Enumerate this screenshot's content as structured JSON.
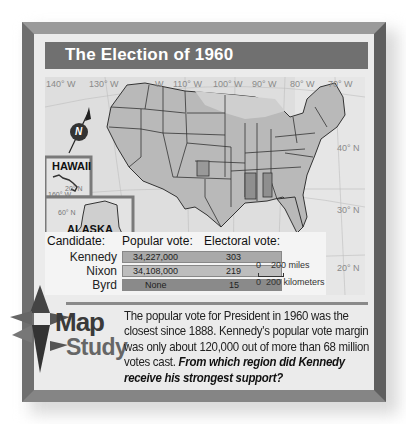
{
  "title": "The Election of 1960",
  "map": {
    "longitude_labels": [
      "140° W",
      "130° W",
      "W",
      "110° W",
      "100° W",
      "90° W",
      "80° W",
      "70° W"
    ],
    "latitude_labels": [
      "40° N",
      "30° N",
      "20° N"
    ],
    "compass_icon": "north-arrow",
    "compass_letter": "N",
    "insets": {
      "hawaii": {
        "label": "HAWAII",
        "lat": "20° N",
        "lon": "160° W"
      },
      "alaska": {
        "label": "ALASKA",
        "lat": "60° N",
        "lon": "170° W"
      }
    },
    "scale": {
      "miles": "0    200 miles",
      "km": "0  200 kilometers"
    }
  },
  "legend": {
    "headers": {
      "candidate": "Candidate:",
      "popular": "Popular vote:",
      "electoral": "Electoral vote:"
    },
    "rows": [
      {
        "candidate": "Kennedy",
        "popular": "34,227,000",
        "electoral": "303",
        "color": "#a9a9a9"
      },
      {
        "candidate": "Nixon",
        "popular": "34,108,000",
        "electoral": "219",
        "color": "#bdbdbd"
      },
      {
        "candidate": "Byrd",
        "popular": "None",
        "electoral": "15",
        "color": "#8a8a8a"
      }
    ]
  },
  "map_study": {
    "badge_line1": "Map",
    "badge_line2": "Study",
    "text": "The popular vote for President in 1960 was the closest since 1888. Kennedy's popular vote margin was only about 120,000 out of more than 68 million votes cast. ",
    "question": "From which region did Kennedy receive his strongest support?"
  }
}
